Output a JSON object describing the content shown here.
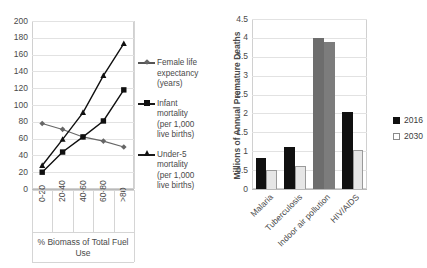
{
  "chart_data": [
    {
      "type": "line",
      "title": "",
      "xlabel": "% Biomass of Total Fuel Use",
      "ylabel": "",
      "ylim": [
        0,
        200
      ],
      "yticks": [
        "0",
        "20",
        "40",
        "60",
        "80",
        "100",
        "120",
        "140",
        "160",
        "180",
        "200"
      ],
      "grid": true,
      "legend_position": "right",
      "categories": [
        "0-20",
        "20-40",
        "40-60",
        "60-80",
        ">80"
      ],
      "series": [
        {
          "name": "Female life expectancy (years)",
          "name_lines": [
            "Female life",
            "expectancy",
            "(years)"
          ],
          "marker": "diamond",
          "color": "#666666",
          "values": [
            78,
            71,
            62,
            57,
            50
          ]
        },
        {
          "name": "Infant mortality (per 1,000 live births)",
          "name_lines": [
            "Infant",
            "mortality",
            "(per 1,000",
            "live births)"
          ],
          "marker": "square",
          "color": "#101010",
          "values": [
            20,
            44,
            62,
            81,
            118
          ]
        },
        {
          "name": "Under-5 mortality (per 1,000 live births)",
          "name_lines": [
            "Under-5",
            "mortality",
            "(per 1,000",
            "live births)"
          ],
          "marker": "triangle",
          "color": "#101010",
          "values": [
            28,
            59,
            91,
            135,
            173
          ]
        }
      ]
    },
    {
      "type": "bar",
      "title": "",
      "xlabel": "",
      "ylabel": "Millions of Annual Premature Deaths",
      "ylim": [
        0,
        4.5
      ],
      "yticks": [
        "0",
        "0.5",
        "1",
        "1.5",
        "2",
        "2.5",
        "3",
        "3.5",
        "4",
        "4.5"
      ],
      "grid": true,
      "legend_position": "right",
      "categories": [
        "Malaria",
        "Tuberculosis",
        "Indoor air pollution",
        "HIV/AIDS"
      ],
      "series": [
        {
          "name": "2016",
          "color": "#101010",
          "values": [
            0.83,
            1.1,
            4.0,
            2.05
          ]
        },
        {
          "name": "2030",
          "color": "#e6e6e6",
          "values": [
            0.5,
            0.6,
            3.9,
            1.02
          ]
        }
      ]
    }
  ],
  "left_chart": {
    "y_ticks": [
      "200",
      "180",
      "160",
      "140",
      "120",
      "100",
      "80",
      "60",
      "40",
      "20",
      "0"
    ],
    "x_categories": [
      "0-20",
      "20-40",
      "40-60",
      "60-80",
      ">80"
    ],
    "x_axis_title_line1": "% Biomass of Total Fuel",
    "x_axis_title_line2": "Use",
    "legend": [
      {
        "lines": [
          "Female life",
          "expectancy",
          "(years)"
        ]
      },
      {
        "lines": [
          "Infant",
          "mortality",
          "(per 1,000",
          "live births)"
        ]
      },
      {
        "lines": [
          "Under-5",
          "mortality",
          "(per 1,000",
          "live births)"
        ]
      }
    ]
  },
  "right_chart": {
    "y_ticks": [
      "4.5",
      "4",
      "3.5",
      "3",
      "2.5",
      "2",
      "1.5",
      "1",
      "0.5",
      "0"
    ],
    "y_axis_title": "Millions of Annual Premature Deaths",
    "x_categories": [
      "Malaria",
      "Tuberculosis",
      "Indoor air pollution",
      "HIV/AIDS"
    ],
    "legend": {
      "series_2016": "2016",
      "series_2030": "2030"
    }
  }
}
